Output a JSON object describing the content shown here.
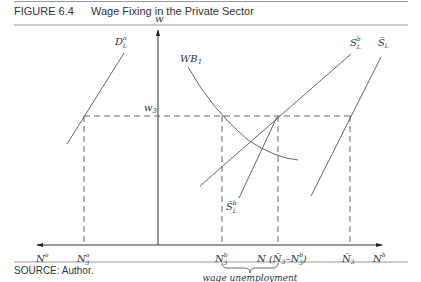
{
  "figure": {
    "number": "FIGURE 6.4",
    "title": "Wage Fixing in the Private Sector",
    "source": "SOURCE: Author."
  },
  "axes": {
    "vertical_label": "w",
    "wage_level_label": "w",
    "wage_level_sub": "3",
    "left_axis_label": "N",
    "left_axis_sup": "o",
    "right_axis_label": "N",
    "right_axis_sup": "b"
  },
  "curves": {
    "demand": {
      "label": "D",
      "sup": "o",
      "sub": "L"
    },
    "wage_bill": {
      "label": "WB",
      "sub": "1"
    },
    "supply_b": {
      "label": "S",
      "sup": "b",
      "sub": "L"
    },
    "supply_bar": {
      "label": "S̄",
      "sub": "L"
    },
    "supply_bar_b": {
      "label": "S̄",
      "sup": "b",
      "sub": "L"
    }
  },
  "ticks": {
    "n3o": {
      "label": "N",
      "sup": "o",
      "sub": "3"
    },
    "n3b": {
      "label": "N",
      "sup": "b",
      "sub": "3"
    },
    "n_diff": {
      "label": "N (",
      "bar": "N̄",
      "sub": "3",
      "rest": "–N",
      "rest_sup": "b",
      "rest_sub": "3",
      "close": ")"
    },
    "nbar3": {
      "label": "N̄",
      "sub": "3"
    }
  },
  "annotation": {
    "brace_label": "wage unemployment"
  },
  "colors": {
    "line": "#555555",
    "rule": "#999999"
  }
}
